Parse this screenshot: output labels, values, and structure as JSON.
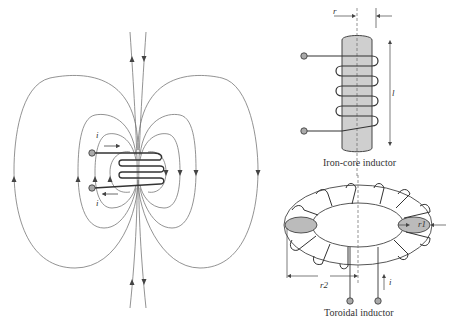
{
  "figures": {
    "solenoid": {
      "current_top_label": "i",
      "current_bottom_label": "i"
    },
    "iron_core": {
      "caption": "Iron-core inductor",
      "radius_label": "r",
      "length_label": "l"
    },
    "toroid": {
      "caption": "Toroidal inductor",
      "r1_label": "r1",
      "r2_label": "r2",
      "current_label": "i"
    }
  },
  "colors": {
    "line": "#555555",
    "coil": "#333333",
    "core_fill": "#cccccc",
    "terminal_fill": "#aaaaaa"
  }
}
